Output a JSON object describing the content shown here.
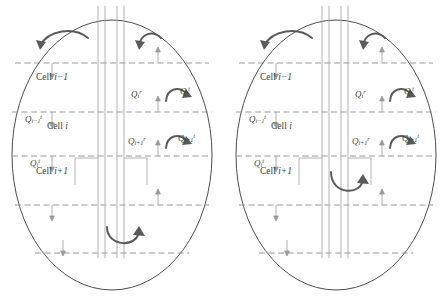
{
  "figure": {
    "name": "wellbore-reservoir-cell-flow-diagram",
    "panel_count": 2,
    "colors": {
      "outline": "#4d4d4d",
      "dashed_line": "#8c8c8c",
      "pipe_line": "#a0a0a0",
      "arrow": "#5a5a5a",
      "thin_arrow": "#9a9a9a",
      "text": "#3a3a3a",
      "background": "#ffffff"
    },
    "panels": [
      {
        "id": "panel-left",
        "cells": [
          {
            "label_prefix": "Cell",
            "index": "i−1"
          },
          {
            "label_prefix": "Cell",
            "index": "i"
          },
          {
            "label_prefix": "Cell",
            "index": "i+1"
          }
        ],
        "flow_labels": [
          {
            "id": "q-left-upper",
            "symbol": "Q",
            "sub": "i−1",
            "sup": "t"
          },
          {
            "id": "q-left-lower",
            "symbol": "Q",
            "sub": "i",
            "sup": "t"
          },
          {
            "id": "q-mid-upper",
            "symbol": "Q",
            "sub": "i",
            "sup": "r"
          },
          {
            "id": "q-right-upper",
            "symbol": "Q",
            "sub": "i",
            "sup": "t"
          },
          {
            "id": "q-mid-lower",
            "symbol": "Q",
            "sub": "i+1",
            "sup": "r"
          },
          {
            "id": "q-right-lower",
            "symbol": "Q",
            "sub": "i+1",
            "sup": "t"
          }
        ],
        "interface_lines_y": [
          63,
          112,
          156,
          205,
          253
        ],
        "pipe_lines_x": [
          98,
          105,
          117,
          124
        ]
      },
      {
        "id": "panel-right",
        "cells": [
          {
            "label_prefix": "Cell",
            "index": "i−1"
          },
          {
            "label_prefix": "Cell",
            "index": "i"
          },
          {
            "label_prefix": "Cell",
            "index": "i+1"
          }
        ],
        "flow_labels": [
          {
            "id": "q-left-upper",
            "symbol": "Q",
            "sub": "i−1",
            "sup": "t"
          },
          {
            "id": "q-left-lower",
            "symbol": "Q",
            "sub": "i",
            "sup": "t"
          },
          {
            "id": "q-mid-upper",
            "symbol": "Q",
            "sub": "i",
            "sup": "r"
          },
          {
            "id": "q-right-upper",
            "symbol": "Q",
            "sub": "i",
            "sup": "t"
          },
          {
            "id": "q-mid-lower",
            "symbol": "Q",
            "sub": "i+1",
            "sup": "r"
          },
          {
            "id": "q-right-lower",
            "symbol": "Q",
            "sub": "i+1",
            "sup": "t"
          }
        ],
        "interface_lines_y": [
          63,
          112,
          156,
          205,
          253
        ],
        "pipe_lines_x": [
          98,
          105,
          117,
          124
        ]
      }
    ]
  }
}
